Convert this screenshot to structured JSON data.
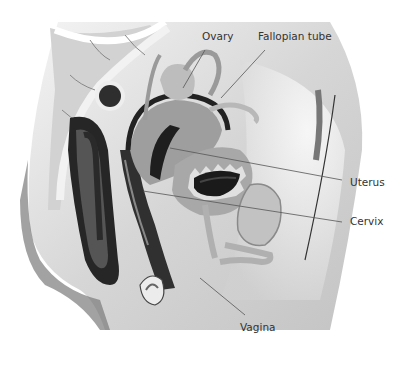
{
  "diagram": {
    "type": "anatomical-cross-section",
    "labels": [
      {
        "id": "ovary",
        "text": "Ovary"
      },
      {
        "id": "fallopian-tube",
        "text": "Fallopian tube"
      },
      {
        "id": "uterus",
        "text": "Uterus"
      },
      {
        "id": "cervix",
        "text": "Cervix"
      },
      {
        "id": "vagina",
        "text": "Vagina"
      }
    ]
  },
  "colors": {
    "background": "#ffffff",
    "body_light": "#e6e6e6",
    "body_mid": "#bdbdbd",
    "body_dark": "#8a8a8a",
    "organ_dark": "#2a2a2a",
    "text": "#333333"
  }
}
